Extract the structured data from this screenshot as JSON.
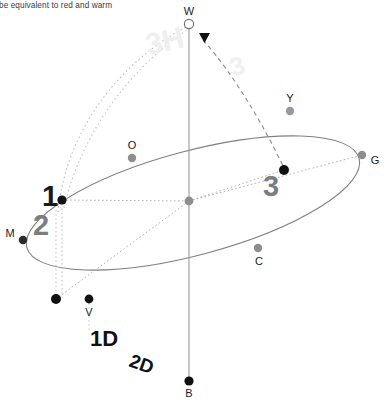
{
  "caption": {
    "text": "o be equivalent to red and warm"
  },
  "colors": {
    "background": "#ffffff",
    "ellipse_stroke": "#7f7f7f",
    "axis_stroke": "#9a9a9a",
    "dotted_stroke": "#b0b0b0",
    "dashed_stroke": "#8c8c8c",
    "point_black": "#111111",
    "point_gray": "#8e8e8e",
    "label_dark": "#1a1a1a",
    "label_gray": "#7d7d7d",
    "watermark": "#efefef"
  },
  "diagram": {
    "type": "tilted-ellipse-orbit",
    "points": [
      {
        "id": "W",
        "label": "W",
        "x": 189,
        "y": 24,
        "marker": "hollow-circle",
        "r": 4.6,
        "label_dx": 0,
        "label_dy": -9
      },
      {
        "id": "B",
        "label": "B",
        "x": 189,
        "y": 381,
        "marker": "filled",
        "r": 4.6,
        "label_dx": 0,
        "label_dy": 16
      },
      {
        "id": "M",
        "label": "M",
        "x": 23,
        "y": 240,
        "marker": "filled",
        "r": 4.2,
        "label_dx": -13,
        "label_dy": -3
      },
      {
        "id": "G",
        "label": "G",
        "x": 362,
        "y": 155,
        "marker": "gray",
        "r": 4.2,
        "label_dx": 13,
        "label_dy": 9
      },
      {
        "id": "O",
        "label": "O",
        "x": 132,
        "y": 158,
        "marker": "gray",
        "r": 4.2,
        "label_dx": 0,
        "label_dy": -9
      },
      {
        "id": "C",
        "label": "C",
        "x": 258,
        "y": 248,
        "marker": "gray",
        "r": 4.2,
        "label_dx": 1,
        "label_dy": 17
      },
      {
        "id": "Y",
        "label": "Y",
        "x": 290,
        "y": 111,
        "marker": "gray",
        "r": 4.2,
        "label_dx": 0,
        "label_dy": -9
      },
      {
        "id": "V",
        "label": "V",
        "x": 89,
        "y": 299,
        "marker": "filled",
        "r": 4.4,
        "label_dx": 0,
        "label_dy": 17
      },
      {
        "id": "P1",
        "label": "",
        "x": 56,
        "y": 299,
        "marker": "filled",
        "r": 5.0,
        "label_dx": 0,
        "label_dy": 0
      },
      {
        "id": "P2",
        "label": "",
        "x": 62,
        "y": 200,
        "marker": "filled",
        "r": 4.6,
        "label_dx": 0,
        "label_dy": 0
      },
      {
        "id": "P3",
        "label": "",
        "x": 284,
        "y": 170,
        "marker": "filled",
        "r": 5.0,
        "label_dx": 0,
        "label_dy": 0
      },
      {
        "id": "CEN",
        "label": "",
        "x": 189,
        "y": 201,
        "marker": "gray",
        "r": 4.4,
        "label_dx": 0,
        "label_dy": 0
      }
    ],
    "number_labels": [
      {
        "text": "1",
        "x": 50,
        "y": 206,
        "size": 29,
        "color": "dark",
        "rotate": 0,
        "weight": "bold"
      },
      {
        "text": "2",
        "x": 41,
        "y": 235,
        "size": 29,
        "color": "gray",
        "rotate": 0,
        "weight": "bold"
      },
      {
        "text": "3",
        "x": 271,
        "y": 196,
        "size": 29,
        "color": "gray",
        "rotate": 0,
        "weight": "bold"
      }
    ],
    "text_labels": [
      {
        "text": "1D",
        "x": 90,
        "y": 346,
        "size": 22,
        "color": "dark",
        "rotate": 0,
        "weight": "bold"
      },
      {
        "text": "2D",
        "x": 128,
        "y": 366,
        "size": 19,
        "color": "dark",
        "rotate": 20,
        "weight": "bold"
      }
    ],
    "watermarks": [
      {
        "text": "3H",
        "x": 148,
        "y": 55,
        "size": 30,
        "rotate": -12
      },
      {
        "text": "3",
        "x": 233,
        "y": 77,
        "size": 26,
        "rotate": -18
      }
    ],
    "axis": {
      "x": 189,
      "y_top": 24,
      "y_bottom": 381
    },
    "arrow": {
      "x": 204,
      "y": 38,
      "direction": "down"
    }
  }
}
